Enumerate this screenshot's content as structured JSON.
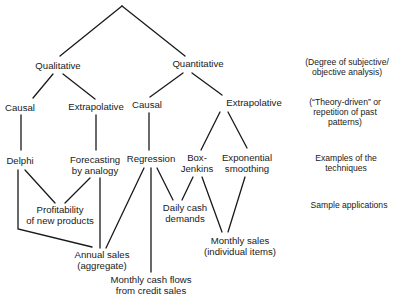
{
  "diagram": {
    "type": "tree",
    "levels": {
      "root": "",
      "level1": [
        "Qualitative",
        "Quantitative"
      ],
      "level2": [
        "Causal",
        "Extrapolative",
        "Causal",
        "Extrapolative"
      ],
      "techniques": [
        "Delphi",
        "Forecasting\nby analogy",
        "Regression",
        "Box-\nJenkins",
        "Exponential\nsmoothing"
      ],
      "applications": [
        "Profitability\nof new products",
        "Daily cash\ndemands",
        "Annual sales\n(aggregate)",
        "Monthly sales\n(individual items)",
        "Monthly cash flows\nfrom credit sales"
      ]
    },
    "nodes": {
      "qualitative": "Qualitative",
      "quantitative": "Quantitative",
      "causal_qual": "Causal",
      "extrap_qual": "Extrapolative",
      "causal_quant": "Causal",
      "extrap_quant": "Extrapolative",
      "delphi": "Delphi",
      "forecasting_l1": "Forecasting",
      "forecasting_l2": "by analogy",
      "regression": "Regression",
      "boxjenkins_l1": "Box-",
      "boxjenkins_l2": "Jenkins",
      "exponential_l1": "Exponential",
      "exponential_l2": "smoothing",
      "profitability_l1": "Profitability",
      "profitability_l2": "of new products",
      "daily_cash_l1": "Daily cash",
      "daily_cash_l2": "demands",
      "annual_sales_l1": "Annual sales",
      "annual_sales_l2": "(aggregate)",
      "monthly_sales_l1": "Monthly sales",
      "monthly_sales_l2": "(individual items)",
      "monthly_cash_l1": "Monthly cash flows",
      "monthly_cash_l2": "from credit sales"
    },
    "edges": [
      [
        "root",
        "Qualitative"
      ],
      [
        "root",
        "Quantitative"
      ],
      [
        "Qualitative",
        "Causal"
      ],
      [
        "Qualitative",
        "Extrapolative"
      ],
      [
        "Quantitative",
        "Causal"
      ],
      [
        "Quantitative",
        "Extrapolative"
      ],
      [
        "Causal (qual)",
        "Delphi"
      ],
      [
        "Extrapolative (qual)",
        "Forecasting by analogy"
      ],
      [
        "Causal (quant)",
        "Regression"
      ],
      [
        "Extrapolative (quant)",
        "Box-Jenkins"
      ],
      [
        "Extrapolative (quant)",
        "Exponential smoothing"
      ],
      [
        "Delphi",
        "Profitability of new products"
      ],
      [
        "Delphi",
        "Annual sales (aggregate)"
      ],
      [
        "Forecasting by analogy",
        "Profitability of new products"
      ],
      [
        "Forecasting by analogy",
        "Annual sales (aggregate)"
      ],
      [
        "Regression",
        "Annual sales (aggregate)"
      ],
      [
        "Regression",
        "Monthly cash flows from credit sales"
      ],
      [
        "Regression",
        "Daily cash demands"
      ],
      [
        "Box-Jenkins",
        "Daily cash demands"
      ],
      [
        "Box-Jenkins",
        "Monthly sales (individual items)"
      ],
      [
        "Exponential smoothing",
        "Monthly sales (individual items)"
      ]
    ]
  },
  "side_labels": {
    "row1_l1": "(Degree of subjective/",
    "row1_l2": "objective analysis)",
    "row2_l1": "(“Theory-driven” or",
    "row2_l2": "repetition of past",
    "row2_l3": "patterns)",
    "row3_l1": "Examples of the",
    "row3_l2": "techniques",
    "row4_l1": "Sample applications"
  },
  "colors": {
    "line": "#1a1a1a",
    "text": "#1a1a1a",
    "background": "#ffffff"
  }
}
